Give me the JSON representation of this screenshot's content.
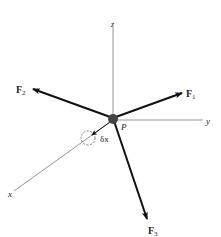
{
  "diagram": {
    "title": "",
    "point_label": "P",
    "axes": {
      "x": {
        "label": "x"
      },
      "y": {
        "label": "y"
      },
      "z": {
        "label": "z"
      }
    },
    "forces": [
      {
        "id": "F1",
        "label": "F",
        "sub": "1"
      },
      {
        "id": "F2",
        "label": "F",
        "sub": "2"
      },
      {
        "id": "F3",
        "label": "F",
        "sub": "3"
      }
    ],
    "displacement": {
      "label": "δx"
    },
    "colors": {
      "axis": "#8a8a8a",
      "force": "#111111",
      "particle": "#444444",
      "text": "#222222"
    }
  }
}
